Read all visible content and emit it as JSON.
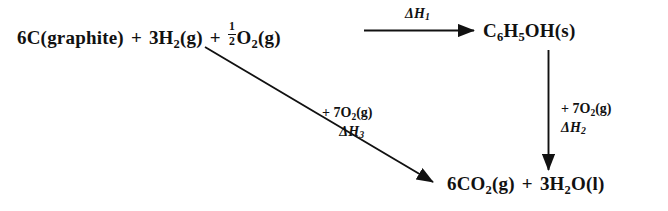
{
  "figure": {
    "type": "thermochemical-cycle-diagram",
    "background_color": "#ffffff",
    "ink_color": "#111111"
  },
  "nodes": {
    "reactants": {
      "terms": [
        {
          "coefficient": "6",
          "formula": "C",
          "state": "(graphite)"
        },
        {
          "coefficient": "3",
          "formula_prefix": "H",
          "subscript": "2",
          "state": "(g)"
        },
        {
          "fraction_numerator": "1",
          "fraction_denominator": "2",
          "formula_prefix": "O",
          "subscript": "2",
          "state": "(g)"
        }
      ],
      "plain_text": "6C(graphite) + 3H2(g) + 1/2 O2(g)"
    },
    "phenol": {
      "plain_text": "C6H5OH(s)",
      "parts": [
        {
          "text": "C"
        },
        {
          "sub": "6"
        },
        {
          "text": "H"
        },
        {
          "sub": "5"
        },
        {
          "text": "OH(s)"
        }
      ]
    },
    "combustion_products": {
      "plain_text": "6CO2(g) + 3H2O(l)",
      "terms": [
        {
          "coefficient": "6",
          "formula_prefix": "CO",
          "subscript": "2",
          "state": "(g)"
        },
        {
          "coefficient": "3",
          "formula_prefix": "H",
          "subscript": "2",
          "formula_suffix": "O",
          "state": "(l)"
        }
      ]
    }
  },
  "arrows": {
    "top_horizontal": {
      "from": "reactants",
      "to": "phenol",
      "label_delta": "ΔH",
      "label_subscript": "1",
      "label_plain": "ΔH1"
    },
    "right_vertical": {
      "from": "phenol",
      "to": "combustion_products",
      "reagent_plus": "+ 7O",
      "reagent_subscript": "2",
      "reagent_state": "(g)",
      "reagent_plain": "+ 7O2(g)",
      "label_delta": "ΔH",
      "label_subscript": "2",
      "label_plain": "ΔH2"
    },
    "diagonal": {
      "from": "reactants",
      "to": "combustion_products",
      "reagent_plus": "+ 7O",
      "reagent_subscript": "2",
      "reagent_state": "(g)",
      "reagent_plain": "+ 7O2(g)",
      "label_delta": "ΔH",
      "label_subscript": "3",
      "label_plain": "ΔH3"
    }
  },
  "symbols": {
    "plus": "+",
    "delta": "Δ"
  }
}
